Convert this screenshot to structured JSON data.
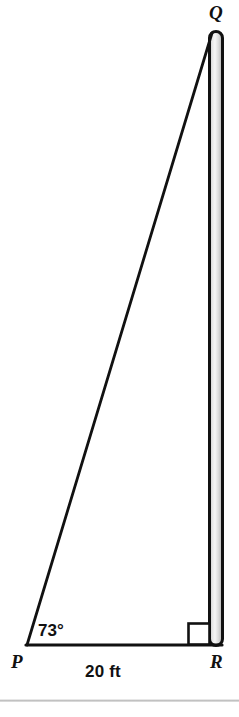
{
  "figure": {
    "kind": "right-triangle-with-vertical-pole",
    "background_color": "#ffffff",
    "stroke_color": "#111111",
    "pole_fill_light": "#f4f4f4",
    "pole_fill_mid": "#d6d6d6",
    "pole_fill_dark": "#bdbdbd",
    "vertices": [
      {
        "id": "Q",
        "label": "Q",
        "role": "apex-top",
        "x": 216,
        "y": 32
      },
      {
        "id": "P",
        "label": "P",
        "role": "vertex-bottom-left",
        "x": 27,
        "y": 645
      },
      {
        "id": "R",
        "label": "R",
        "role": "vertex-bottom-right",
        "x": 216,
        "y": 645
      }
    ],
    "angles": [
      {
        "at": "P",
        "label": "73°",
        "value": 73,
        "unit": "degrees"
      },
      {
        "at": "R",
        "label": "",
        "value": 90,
        "unit": "degrees",
        "marker": "right-angle-square"
      }
    ],
    "sides": [
      {
        "from": "P",
        "to": "R",
        "label": "20 ft",
        "value": 20,
        "unit": "ft",
        "role": "adjacent-base"
      },
      {
        "from": "P",
        "to": "Q",
        "label": "",
        "role": "hypotenuse"
      },
      {
        "from": "Q",
        "to": "R",
        "label": "",
        "role": "opposite-vertical-pole"
      }
    ]
  },
  "labels": {
    "vertex_q": "Q",
    "vertex_p": "P",
    "vertex_r": "R",
    "angle_at_p": "73°",
    "side_base": "20 ft"
  },
  "icons": {
    "right_angle_marker": "right-angle-square-icon"
  }
}
